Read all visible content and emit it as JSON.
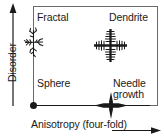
{
  "diagram": {
    "type": "morphology-phase-diagram",
    "axes": {
      "x": {
        "label": "Anisotropy (four-fold)",
        "direction": "increasing-right",
        "arrow": "right-arrow-icon"
      },
      "y": {
        "label": "Disorder",
        "direction": "increasing-up",
        "arrow": "up-arrow-icon"
      }
    },
    "regions": [
      {
        "id": "fractal",
        "label": "Fractal",
        "position": "top-left",
        "glyph": "fractal-cluster-icon"
      },
      {
        "id": "dendrite",
        "label": "Dendrite",
        "position": "top-right",
        "glyph": "dendrite-cross-icon"
      },
      {
        "id": "sphere",
        "label": "Sphere",
        "position": "bottom-left",
        "glyph": "filled-dot-icon"
      },
      {
        "id": "needle",
        "label": "Needle\ngrowth",
        "position": "bottom-right",
        "glyph": "needle-cross-icon"
      }
    ],
    "colors": {
      "line": "#1a1a1a",
      "text": "#1a1a1a",
      "background": "#ffffff",
      "box_border": "#555555"
    }
  }
}
